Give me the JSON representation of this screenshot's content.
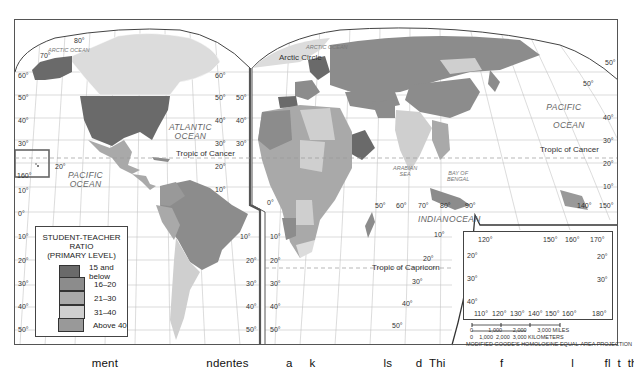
{
  "map": {
    "projection_note": "MODIFIED GOODE'S HOMOLOSINE EQUAL-AREA PROJECTION",
    "colors": {
      "c15_below": "#6a6a6a",
      "c16_20": "#8c8c8c",
      "c21_30": "#a9a9a9",
      "c31_40": "#cfcfcf",
      "c_above40": "#999999",
      "c_nodata": "#dcdcdc",
      "grid": "#bdbdbd",
      "border": "#444444"
    },
    "legend": {
      "title_line1": "STUDENT-TEACHER RATIO",
      "title_line2": "(PRIMARY LEVEL)",
      "items": [
        {
          "label": "15  and below",
          "color": "#6a6a6a"
        },
        {
          "label": "16–20",
          "color": "#8c8c8c"
        },
        {
          "label": "21–30",
          "color": "#a9a9a9"
        },
        {
          "label": "31–40",
          "color": "#cfcfcf"
        },
        {
          "label": "Above 40",
          "color": "#999999"
        },
        {
          "label": "No Data",
          "color": "#dcdcdc"
        }
      ]
    },
    "oceans": {
      "arctic_left": "ARCTIC OCEAN",
      "arctic_right": "ARCTIC OCEAN",
      "atlantic_1": "ATLANTIC",
      "atlantic_2": "OCEAN",
      "pacific_left_1": "PACIFIC",
      "pacific_left_2": "OCEAN",
      "pacific_right_1": "PACIFIC",
      "pacific_right_2": "OCEAN",
      "indian": "INDIAN",
      "indian_ocean": "OCEAN",
      "arabian_1": "ARABIAN",
      "arabian_2": "SEA",
      "bengal_1": "BAY OF",
      "bengal_2": "BENGAL",
      "coral": "CORAL   SEA"
    },
    "lines": {
      "arctic_circle": "Arctic Circle",
      "tropic_cancer_left": "Tropic of Cancer",
      "tropic_cancer_right": "Tropic of Cancer",
      "tropic_capricorn": "Tropic of Capricorn"
    },
    "lat_labels": {
      "l80": "80°",
      "l70": "70°",
      "l60": "60°",
      "l50": "50°",
      "l40": "40°",
      "l30": "30°",
      "l20": "20°",
      "l10": "10°",
      "l0": "0°",
      "l160": "160°"
    },
    "lon_labels": {
      "e50": "50°",
      "e60": "60°",
      "e70": "70°",
      "e80": "80°",
      "e90": "90°",
      "e140": "140°",
      "e150": "150°"
    },
    "inset": {
      "top_ticks": [
        "120°",
        "150°",
        "160°",
        "170°"
      ],
      "bottom_ticks": [
        "110°",
        "120°",
        "130°",
        "140°",
        "150°",
        "160°",
        "180°"
      ],
      "left_ticks": [
        "20°",
        "30°",
        "40°"
      ],
      "right_ticks": [
        "20°",
        "30°"
      ]
    },
    "scale": {
      "miles": "0          1,000       2,000       3,000 MILES",
      "km": "0    1,000  2,000  3,000 KILOMETERS"
    },
    "caption": "                           ment                          ndentes           a     k                    ls       d  Thi                f                    l         fl  t  th          lit    f   d       t    l"
  }
}
